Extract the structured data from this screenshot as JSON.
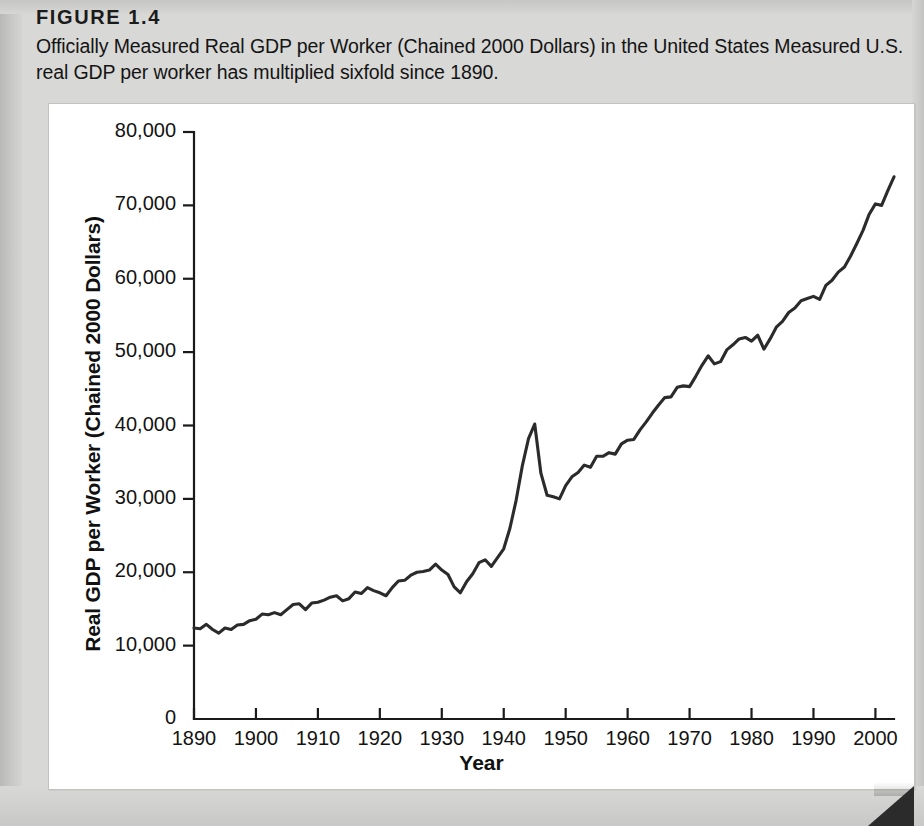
{
  "figure": {
    "number": "FIGURE 1.4",
    "caption": "Officially Measured Real GDP per Worker (Chained 2000 Dollars) in the United States Measured U.S. real GDP per worker has multiplied sixfold since 1890."
  },
  "colors": {
    "page_background": "#d8d8d6",
    "card_background": "#ffffff",
    "line": "#2b2b2b",
    "axis": "#1a1a1a",
    "text": "#131313"
  },
  "chart_data": {
    "type": "line",
    "title": "Officially Measured Real GDP per Worker (Chained 2000 Dollars) in the United States",
    "xlabel": "Year",
    "ylabel": "Real GDP per Worker (Chained 2000 Dollars)",
    "xlim": [
      1890,
      2003
    ],
    "ylim": [
      0,
      80000
    ],
    "grid": false,
    "legend": "none",
    "xticks": [
      1890,
      1900,
      1910,
      1920,
      1930,
      1940,
      1950,
      1960,
      1970,
      1980,
      1990,
      2000
    ],
    "xtick_labels": [
      "1890",
      "1900",
      "1910",
      "1920",
      "1930",
      "1940",
      "1950",
      "1960",
      "1970",
      "1980",
      "1990",
      "2000"
    ],
    "yticks": [
      0,
      10000,
      20000,
      30000,
      40000,
      50000,
      60000,
      70000,
      80000
    ],
    "ytick_labels": [
      "0",
      "10,000",
      "20,000",
      "30,000",
      "40,000",
      "50,000",
      "60,000",
      "70,000",
      "80,000"
    ],
    "series": [
      {
        "name": "Real GDP per Worker",
        "x": [
          1890,
          1891,
          1892,
          1893,
          1894,
          1895,
          1896,
          1897,
          1898,
          1899,
          1900,
          1901,
          1902,
          1903,
          1904,
          1905,
          1906,
          1907,
          1908,
          1909,
          1910,
          1911,
          1912,
          1913,
          1914,
          1915,
          1916,
          1917,
          1918,
          1919,
          1920,
          1921,
          1922,
          1923,
          1924,
          1925,
          1926,
          1927,
          1928,
          1929,
          1930,
          1931,
          1932,
          1933,
          1934,
          1935,
          1936,
          1937,
          1938,
          1939,
          1940,
          1941,
          1942,
          1943,
          1944,
          1945,
          1946,
          1947,
          1948,
          1949,
          1950,
          1951,
          1952,
          1953,
          1954,
          1955,
          1956,
          1957,
          1958,
          1959,
          1960,
          1961,
          1962,
          1963,
          1964,
          1965,
          1966,
          1967,
          1968,
          1969,
          1970,
          1971,
          1972,
          1973,
          1974,
          1975,
          1976,
          1977,
          1978,
          1979,
          1980,
          1981,
          1982,
          1983,
          1984,
          1985,
          1986,
          1987,
          1988,
          1989,
          1990,
          1991,
          1992,
          1993,
          1994,
          1995,
          1996,
          1997,
          1998,
          1999,
          2000,
          2001,
          2002,
          2003
        ],
        "y": [
          12400,
          12300,
          12900,
          12200,
          11700,
          12400,
          12200,
          12800,
          12900,
          13400,
          13600,
          14300,
          14200,
          14500,
          14200,
          14900,
          15600,
          15700,
          14900,
          15800,
          15900,
          16200,
          16600,
          16800,
          16100,
          16400,
          17300,
          17100,
          17900,
          17500,
          17200,
          16800,
          17900,
          18800,
          18900,
          19600,
          20000,
          20100,
          20300,
          21100,
          20300,
          19700,
          18000,
          17200,
          18700,
          19800,
          21300,
          21700,
          20800,
          22000,
          23200,
          26000,
          29800,
          34500,
          38200,
          40200,
          33500,
          30500,
          30300,
          30000,
          31800,
          33000,
          33600,
          34600,
          34300,
          35800,
          35800,
          36300,
          36100,
          37500,
          38000,
          38100,
          39400,
          40500,
          41700,
          42800,
          43800,
          43900,
          45200,
          45400,
          45300,
          46700,
          48200,
          49500,
          48400,
          48700,
          50300,
          51000,
          51800,
          52000,
          51500,
          52300,
          50400,
          51800,
          53400,
          54200,
          55400,
          56000,
          57000,
          57300,
          57600,
          57200,
          59100,
          59800,
          60900,
          61600,
          63100,
          64800,
          66600,
          68800,
          70200,
          70000,
          72000,
          73900
        ]
      }
    ],
    "annotations": []
  },
  "axis_titles": {
    "y": "Real GDP per Worker (Chained 2000 Dollars)",
    "x": "Year"
  }
}
